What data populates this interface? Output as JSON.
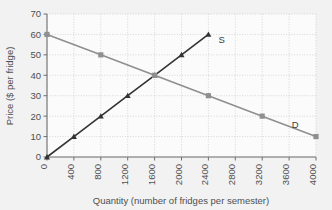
{
  "chart_data": {
    "type": "line",
    "title": "",
    "xlabel": "Quantity (number of fridges per semester)",
    "ylabel": "Price ($ per fridge)",
    "xlim": [
      0,
      4000
    ],
    "ylim": [
      0,
      70
    ],
    "xticks": [
      0,
      400,
      800,
      1200,
      1600,
      2000,
      2400,
      2800,
      3200,
      3600,
      4000
    ],
    "xtick_labels": [
      "0",
      "400",
      "800",
      "1200",
      "1600",
      "2000",
      "2400",
      "2800",
      "3200",
      "3600",
      "4000"
    ],
    "yticks": [
      0,
      10,
      20,
      30,
      40,
      50,
      60,
      70
    ],
    "ytick_labels": [
      "0",
      "10",
      "20",
      "30",
      "40",
      "50",
      "60",
      "70"
    ],
    "grid": true,
    "legend_position": "inline-annotations",
    "series": [
      {
        "name": "S",
        "label": "S",
        "role": "supply",
        "color": "#333333",
        "marker": "triangle",
        "x": [
          0,
          400,
          800,
          1200,
          1600,
          2000,
          2400
        ],
        "values": [
          0,
          10,
          20,
          30,
          40,
          50,
          60
        ],
        "annotation": {
          "text": "S",
          "x": 2550,
          "y": 56
        }
      },
      {
        "name": "D",
        "label": "D",
        "role": "demand",
        "color": "#8f8f8f",
        "marker": "square",
        "x": [
          0,
          800,
          1600,
          2400,
          3200,
          4000
        ],
        "values": [
          60,
          50,
          40,
          30,
          20,
          10
        ],
        "annotation": {
          "text": "D",
          "x": 3640,
          "y": 14
        }
      }
    ],
    "equilibrium": {
      "quantity": 1600,
      "price": 40
    }
  },
  "colors": {
    "background": "#f2f2f2",
    "plot_background": "#fbfbfb",
    "grid": "#c9c9c9",
    "axis": "#6f6f6f",
    "supply": "#333333",
    "demand": "#8f8f8f"
  }
}
